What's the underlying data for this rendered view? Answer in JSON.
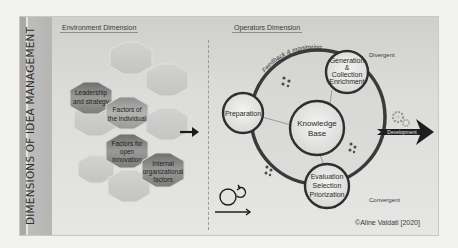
{
  "diagram": {
    "title": "DIMENSIONS OF IDEA MANAGEMENT",
    "environment": {
      "title": "Environment Dimension",
      "factors": [
        {
          "label_lines": [
            "Leadership",
            "and strategy"
          ]
        },
        {
          "label_lines": [
            "Factors of",
            "the individual"
          ]
        },
        {
          "label_lines": [
            "Factors for",
            "open",
            "innovation"
          ]
        },
        {
          "label_lines": [
            "Internal",
            "organizational",
            "factors"
          ]
        }
      ]
    },
    "operators": {
      "title": "Operators Dimension",
      "cycle_label": "Feedback & monitoring",
      "stages": {
        "preparation": {
          "label_lines": [
            "Preparation"
          ]
        },
        "generation": {
          "label_lines": [
            "Generation",
            "&",
            "Collection",
            "Enrichment"
          ]
        },
        "knowledge_base": {
          "label_lines": [
            "Knowledge",
            "Base"
          ]
        },
        "evaluation": {
          "label_lines": [
            "Evaluation",
            "Selection",
            "Priorization"
          ]
        }
      },
      "divergent_label": "Divergent",
      "convergent_label": "Convergent",
      "output_label": "Development"
    },
    "credit": "©Aline Valdati [2020]",
    "icons": [
      "people-network-icon",
      "gears-icon",
      "iteration-loop-icon",
      "right-arrow-icon"
    ],
    "colors": {
      "frame_bg": "#dcdcda",
      "sidebar": "#b5b5b3",
      "ring": "#3a3a3a",
      "highlight_hex": "#8a8a88",
      "faded_hex": "#c9c9c7",
      "arrow": "#1a1a1a"
    }
  }
}
